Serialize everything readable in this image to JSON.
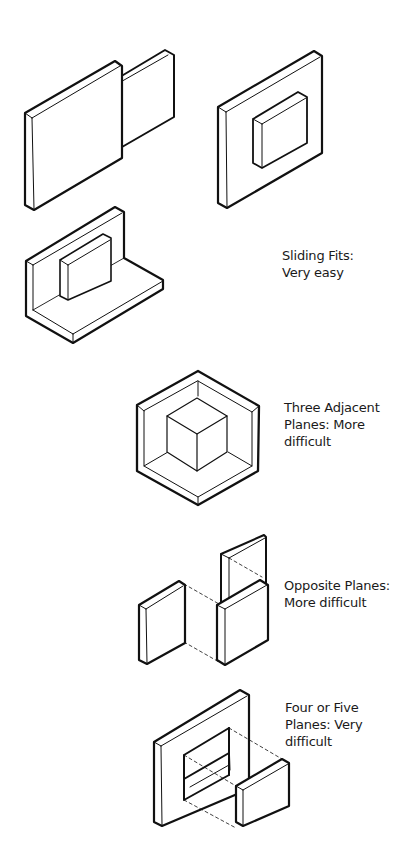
{
  "diagram": {
    "groups": [
      {
        "id": "sliding-fits",
        "label_lines": [
          "Sliding Fits:",
          "Very easy"
        ],
        "figures": [
          "two-offset-plates",
          "plate-with-raised-block",
          "l-bracket-with-block"
        ]
      },
      {
        "id": "three-adjacent-planes",
        "label_lines": [
          "Three Adjacent",
          "Planes: More",
          "difficult"
        ],
        "figures": [
          "cube-in-corner"
        ]
      },
      {
        "id": "opposite-planes",
        "label_lines": [
          "Opposite Planes:",
          "More difficult"
        ],
        "figures": [
          "opposite-plates-with-dashed-projection"
        ]
      },
      {
        "id": "four-or-five-planes",
        "label_lines": [
          "Four or Five",
          "Planes: Very",
          "difficult"
        ],
        "figures": [
          "frame-with-opening-and-block"
        ]
      }
    ],
    "colors": {
      "line": "#111111",
      "background": "#ffffff",
      "text": "#1a1a1a"
    }
  }
}
